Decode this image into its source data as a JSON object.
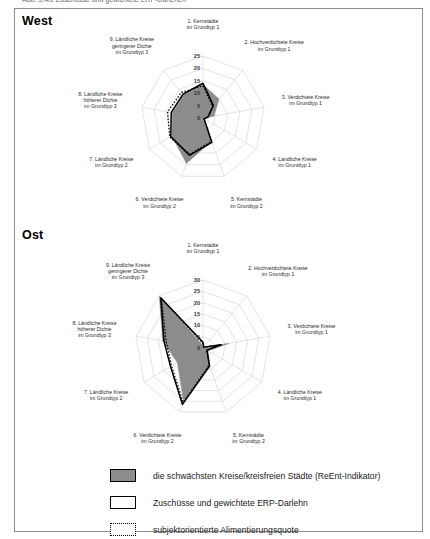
{
  "top_caption_sliver": "Abb. 3.4/2  Zuschüsse und gewichtete ERP-Darlehen",
  "sections": [
    {
      "id": "west",
      "title": "West"
    },
    {
      "id": "ost",
      "title": "Ost"
    }
  ],
  "legend": {
    "items": [
      {
        "swatch": "filled",
        "label": "die schwächsten Kreise/kreisfreien Städte (ReEnt-Indikator)"
      },
      {
        "swatch": "outline",
        "label": "Zuschüsse und gewichtete ERP-Darlehn"
      },
      {
        "swatch": "dotted",
        "label": "subjektorientierte Alimentierungsquote"
      }
    ]
  },
  "chart_data": [
    {
      "id": "west",
      "type": "radar",
      "title": "West",
      "categories": [
        "1. Kernstädte\nim Grundtyp 1",
        "2. Hochverdichtete Kreise\nim Grundtyp 1",
        "3. Verdichtete Kreise\nim Grundtyp 1",
        "4. Ländliche Kreise\nim Grundtyp 1",
        "5. Kernstädte\nim Grundtyp 2",
        "6. Verdichtete Kreise\nim Grundtyp 2",
        "7. Ländliche Kreise\nim Grundtyp 2",
        "8. Ländliche Kreise\nhöherer Dichte\nim Grundtyp 3",
        "9. Ländliche Kreise\ngeringerer Dichte\nim Grundtyp 3"
      ],
      "tick_labels": [
        "0",
        "5",
        "10",
        "15",
        "20",
        "25"
      ],
      "rlim": [
        0,
        25
      ],
      "grid": true,
      "legend_position": "bottom",
      "series": [
        {
          "name": "die schwächsten Kreise/kreisfreien Städte (ReEnt-Indikator)",
          "style": "filled",
          "values": [
            13.5,
            10.0,
            4.5,
            0.5,
            10.0,
            19.5,
            14.5,
            12.5,
            12.0
          ]
        },
        {
          "name": "Zuschüsse und gewichtete ERP-Darlehn",
          "style": "outline",
          "values": [
            14.0,
            6.5,
            2.0,
            0.5,
            10.5,
            16.0,
            15.0,
            13.0,
            12.5
          ]
        },
        {
          "name": "subjektorientierte Alimentierungsquote",
          "style": "dotted",
          "values": [
            13.0,
            6.0,
            2.0,
            0.5,
            10.0,
            15.5,
            15.5,
            14.5,
            13.5
          ]
        }
      ]
    },
    {
      "id": "ost",
      "type": "radar",
      "title": "Ost",
      "categories": [
        "1. Kernstädte\nim Grundtyp 1",
        "2. Hochverdichtete Kreise\nim Grundtyp 1",
        "3. Verdichtete Kreise\nim Grundtyp 1",
        "4. Ländliche Kreise\nim Grundtyp 1",
        "5. Kernstädte\nim Grundtyp 2",
        "6. Verdichtete Kreise\nim Grundtyp 2",
        "7. Ländliche Kreise\nim Grundtyp 2",
        "8. Ländliche Kreise\nhöherer Dichte\nim Grundtyp 3",
        "9. Ländliche Kreise\ngeringerer Dichte\nim Grundtyp 3"
      ],
      "tick_labels": [
        "0",
        "5",
        "10",
        "15",
        "20",
        "25",
        "30"
      ],
      "rlim": [
        0,
        30
      ],
      "grid": true,
      "legend_position": "bottom",
      "series": [
        {
          "name": "die schwächsten Kreise/kreisfreien Städte (ReEnt-Indikator)",
          "style": "filled",
          "values": [
            1.0,
            0.5,
            11.5,
            2.5,
            8.5,
            25.0,
            13.0,
            18.0,
            30.0
          ]
        },
        {
          "name": "Zuschüsse und gewichtete ERP-Darlehn",
          "style": "outline",
          "values": [
            2.5,
            0.5,
            8.0,
            2.0,
            8.5,
            26.5,
            16.5,
            17.5,
            29.0
          ]
        },
        {
          "name": "subjektorientierte Alimentierungsquote",
          "style": "dotted",
          "values": [
            2.0,
            0.5,
            8.5,
            2.0,
            8.0,
            25.5,
            16.0,
            16.5,
            28.5
          ]
        }
      ]
    }
  ]
}
